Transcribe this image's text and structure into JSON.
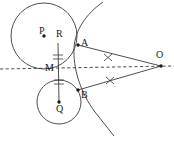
{
  "figure": {
    "background": "#ffffff",
    "stroke_color": "#3a3a3a",
    "label_color": "#1a1a1a",
    "width": 174,
    "height": 141
  },
  "points": [
    {
      "id": "P",
      "label": "P",
      "x": 44,
      "y": 36,
      "label_x": 39,
      "label_y": 26,
      "dot": true
    },
    {
      "id": "R",
      "label": "R",
      "x": 58,
      "y": 43,
      "label_x": 56,
      "label_y": 29,
      "dot": false
    },
    {
      "id": "A",
      "label": "A",
      "x": 78,
      "y": 45,
      "label_x": 81,
      "label_y": 38,
      "dot": true
    },
    {
      "id": "M",
      "label": "M",
      "x": 58,
      "y": 69,
      "label_x": 45,
      "label_y": 63,
      "dot": false
    },
    {
      "id": "Q",
      "label": "Q",
      "x": 59,
      "y": 102,
      "label_x": 56,
      "label_y": 104,
      "dot": true
    },
    {
      "id": "B",
      "label": "B",
      "x": 78,
      "y": 90,
      "label_x": 81,
      "label_y": 90,
      "dot": true
    },
    {
      "id": "O",
      "label": "O",
      "x": 161,
      "y": 66,
      "label_x": 156,
      "label_y": 50,
      "dot": true
    }
  ],
  "circles": [
    {
      "id": "circle-P",
      "center_x": 44,
      "center_y": 36,
      "radius": 33
    },
    {
      "id": "circle-Q",
      "center_x": 59,
      "center_y": 102,
      "radius": 22
    }
  ],
  "segments": [
    {
      "id": "OA",
      "x1": 161,
      "y1": 66,
      "x2": 78,
      "y2": 45,
      "style": "solid"
    },
    {
      "id": "OB",
      "x1": 161,
      "y1": 66,
      "x2": 78,
      "y2": 90,
      "style": "solid"
    },
    {
      "id": "RQ",
      "x1": 58,
      "y1": 43,
      "x2": 59,
      "y2": 102,
      "style": "solid"
    }
  ],
  "dashed_line": {
    "id": "axis-OM",
    "x1": 0,
    "y1": 69,
    "x2": 174,
    "y2": 66,
    "style": "dashed"
  },
  "arc": {
    "id": "circle-O-arc",
    "description": "arc centered at O passing through A and B",
    "path": "M 103 2 C 86 14 75 30 74 48 C 73 68 80 92 95 112 C 101 120 108 128 114 136"
  },
  "tick_marks": [
    {
      "id": "tick-OA",
      "x": 108,
      "y": 58,
      "glyph": "x",
      "on": "OA"
    },
    {
      "id": "tick-OB",
      "x": 110,
      "y": 80,
      "glyph": "x",
      "on": "OB"
    },
    {
      "id": "tick-RM-1",
      "x": 58,
      "y": 55,
      "glyph": "dash",
      "on": "RM"
    },
    {
      "id": "tick-RM-2",
      "x": 58,
      "y": 59,
      "glyph": "dash",
      "on": "RM"
    },
    {
      "id": "tick-MQ-1",
      "x": 58,
      "y": 80,
      "glyph": "dash",
      "on": "MQ"
    },
    {
      "id": "tick-MQ-2",
      "x": 58,
      "y": 84,
      "glyph": "dash",
      "on": "MQ"
    }
  ]
}
